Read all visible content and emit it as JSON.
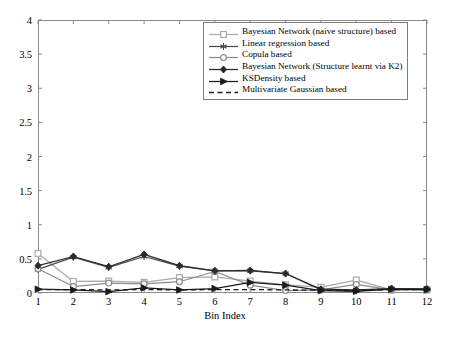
{
  "chart_data": {
    "type": "line",
    "title": "",
    "xlabel": "Bin Index",
    "ylabel": "",
    "x": [
      1,
      2,
      3,
      4,
      5,
      6,
      7,
      8,
      9,
      10,
      11,
      12
    ],
    "categories": [
      "1",
      "2",
      "3",
      "4",
      "5",
      "6",
      "7",
      "8",
      "9",
      "10",
      "11",
      "12"
    ],
    "xlim": [
      1,
      12
    ],
    "ylim": [
      0,
      4
    ],
    "yticks": [
      "0",
      "0.5",
      "1",
      "1.5",
      "2",
      "2.5",
      "3",
      "3.5",
      "4"
    ],
    "ytick_values": [
      0,
      0.5,
      1,
      1.5,
      2,
      2.5,
      3,
      3.5,
      4
    ],
    "grid": false,
    "legend_position": "top-right-inside",
    "series": [
      {
        "name": "Bayesian Network (naive structure) based",
        "marker": "square",
        "color": "#a9a9a9",
        "linestyle": "solid",
        "values": [
          0.58,
          0.17,
          0.175,
          0.155,
          0.225,
          0.235,
          0.175,
          0.12,
          0.085,
          0.19,
          0.045,
          0.045
        ]
      },
      {
        "name": "Linear regression based",
        "marker": "star",
        "color": "#4a4a4a",
        "linestyle": "solid",
        "values": [
          0.345,
          0.525,
          0.375,
          0.535,
          0.395,
          0.325,
          0.325,
          0.285,
          0.045,
          0.035,
          0.06,
          0.055
        ]
      },
      {
        "name": "Copula based",
        "marker": "circle",
        "color": "#8c8c8c",
        "linestyle": "solid",
        "values": [
          0.355,
          0.095,
          0.145,
          0.135,
          0.165,
          0.315,
          0.115,
          0.035,
          0.045,
          0.125,
          0.045,
          0.05
        ]
      },
      {
        "name": "Bayesian Network (Structure learnt via K2)",
        "marker": "diamond",
        "color": "#2b2b2b",
        "linestyle": "solid",
        "values": [
          0.4,
          0.535,
          0.385,
          0.565,
          0.4,
          0.325,
          0.33,
          0.285,
          0.055,
          0.045,
          0.065,
          0.06
        ]
      },
      {
        "name": "KSDensity based",
        "marker": "triangle-right",
        "color": "#1a1a1a",
        "linestyle": "solid",
        "values": [
          0.055,
          0.045,
          0.02,
          0.075,
          0.045,
          0.065,
          0.155,
          0.115,
          0.035,
          0.025,
          0.055,
          0.05
        ]
      },
      {
        "name": "Multivariate Gaussian based",
        "marker": "none",
        "color": "#1a1a1a",
        "linestyle": "dashed",
        "values": [
          0.05,
          0.05,
          0.045,
          0.05,
          0.045,
          0.05,
          0.05,
          0.045,
          0.04,
          0.035,
          0.05,
          0.05
        ]
      }
    ]
  }
}
